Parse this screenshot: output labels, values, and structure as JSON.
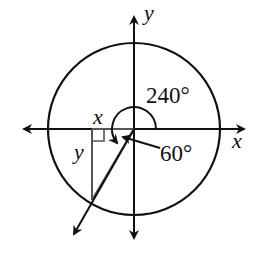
{
  "diagram": {
    "type": "unit-circle-angle",
    "labels": {
      "y_axis": "y",
      "x_axis": "x",
      "angle": "240°",
      "reference_angle": "60°",
      "leg_x": "x",
      "leg_y": "y"
    },
    "angle_degrees": 240,
    "reference_angle_degrees": 60,
    "colors": {
      "stroke": "#111111",
      "triangle": "#555555",
      "background": "#ffffff"
    }
  }
}
